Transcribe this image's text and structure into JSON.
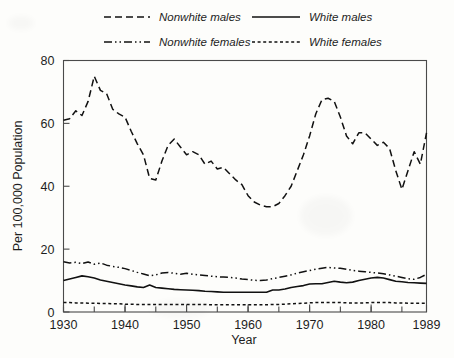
{
  "chart_data": {
    "type": "line",
    "title": "",
    "xlabel": "Year",
    "ylabel": "Per 100,000 Population",
    "xlim": [
      1930,
      1989
    ],
    "ylim": [
      0,
      80
    ],
    "yticks": [
      0,
      20,
      40,
      60,
      80
    ],
    "ytick_labels": [
      "0",
      "20",
      "40",
      "60",
      "80"
    ],
    "xticks": [
      1930,
      1940,
      1950,
      1960,
      1970,
      1980,
      1989
    ],
    "xtick_labels": [
      "1930",
      "1940",
      "1950",
      "1960",
      "1970",
      "1980",
      "1989"
    ],
    "minor_xtick_interval": 5,
    "grid": false,
    "legend_position": "above-plot",
    "x": [
      1930,
      1931,
      1932,
      1933,
      1934,
      1935,
      1936,
      1937,
      1938,
      1939,
      1940,
      1941,
      1942,
      1943,
      1944,
      1945,
      1946,
      1947,
      1948,
      1949,
      1950,
      1951,
      1952,
      1953,
      1954,
      1955,
      1956,
      1957,
      1958,
      1959,
      1960,
      1961,
      1962,
      1963,
      1964,
      1965,
      1966,
      1967,
      1968,
      1969,
      1970,
      1971,
      1972,
      1973,
      1974,
      1975,
      1976,
      1977,
      1978,
      1979,
      1980,
      1981,
      1982,
      1983,
      1984,
      1985,
      1986,
      1987,
      1988,
      1989
    ],
    "series": [
      {
        "name": "Nonwhite males",
        "style": "dashed",
        "values": [
          61,
          61.5,
          64,
          62.5,
          67,
          75,
          70.5,
          69.5,
          64.5,
          63,
          62,
          57.5,
          53.5,
          50,
          42.5,
          42,
          48,
          53,
          55,
          52.5,
          50,
          51,
          50,
          47,
          48,
          45.5,
          46,
          44,
          42,
          40.5,
          37,
          35,
          34,
          33.5,
          33.5,
          34.5,
          37,
          40,
          45,
          50,
          56,
          63,
          67.5,
          68,
          67,
          62,
          56,
          53.5,
          57,
          57,
          55,
          53,
          54,
          52,
          45,
          39,
          45,
          51,
          47,
          57
        ]
      },
      {
        "name": "White males",
        "style": "solid",
        "values": [
          10,
          10.5,
          11,
          11.5,
          11.2,
          10.8,
          10.2,
          9.8,
          9.4,
          9,
          8.6,
          8.3,
          8,
          7.8,
          8.6,
          7.8,
          7.6,
          7.4,
          7.2,
          7.1,
          7,
          6.9,
          6.8,
          6.6,
          6.5,
          6.4,
          6.3,
          6.3,
          6.3,
          6.3,
          6.3,
          6.3,
          6.3,
          6.3,
          7,
          7,
          7.3,
          7.8,
          8.1,
          8.4,
          8.9,
          9,
          9,
          9.4,
          9.8,
          9.5,
          9.3,
          9.5,
          10,
          10.4,
          10.8,
          11,
          10.8,
          10.3,
          9.8,
          9.6,
          9.4,
          9.3,
          9.2,
          9.1
        ]
      },
      {
        "name": "Nonwhite females",
        "style": "dashdotdot",
        "values": [
          16,
          15.6,
          15.8,
          15.4,
          15.9,
          15.2,
          15.6,
          14.9,
          14.5,
          14.2,
          13.8,
          13.2,
          12.6,
          12.1,
          11.5,
          11.8,
          12.4,
          12.6,
          12.3,
          12,
          12.3,
          12,
          11.8,
          11.6,
          11.4,
          11.2,
          11.1,
          11,
          10.8,
          10.5,
          10.3,
          10.1,
          10,
          10.2,
          10.6,
          11,
          11.4,
          11.8,
          12.4,
          12.8,
          13.2,
          13.6,
          13.9,
          14.2,
          14,
          13.9,
          13.6,
          13.2,
          13,
          12.8,
          12.6,
          12.4,
          12.2,
          11.8,
          11.4,
          11,
          10.6,
          10.4,
          11,
          12
        ]
      },
      {
        "name": "White females",
        "style": "dotted",
        "values": [
          3,
          3,
          2.9,
          2.9,
          2.8,
          2.8,
          2.7,
          2.7,
          2.6,
          2.6,
          2.5,
          2.5,
          2.4,
          2.4,
          2.4,
          2.4,
          2.4,
          2.4,
          2.4,
          2.4,
          2.4,
          2.4,
          2.4,
          2.4,
          2.3,
          2.3,
          2.3,
          2.3,
          2.3,
          2.3,
          2.3,
          2.3,
          2.3,
          2.3,
          2.4,
          2.4,
          2.5,
          2.6,
          2.7,
          2.8,
          2.9,
          3,
          3,
          3,
          3,
          3,
          2.9,
          2.9,
          2.9,
          2.9,
          3,
          3,
          3,
          3,
          2.9,
          2.9,
          2.8,
          2.8,
          2.8,
          2.8
        ]
      }
    ]
  },
  "legend": {
    "entries": [
      {
        "label": "Nonwhite males",
        "style": "dashed"
      },
      {
        "label": "White males",
        "style": "solid"
      },
      {
        "label": "Nonwhite females",
        "style": "dashdotdot"
      },
      {
        "label": "White females",
        "style": "dotted"
      }
    ]
  },
  "colors": {
    "ink": "#111111",
    "axis": "#4a4a4a",
    "background": "#fdfdfb"
  }
}
